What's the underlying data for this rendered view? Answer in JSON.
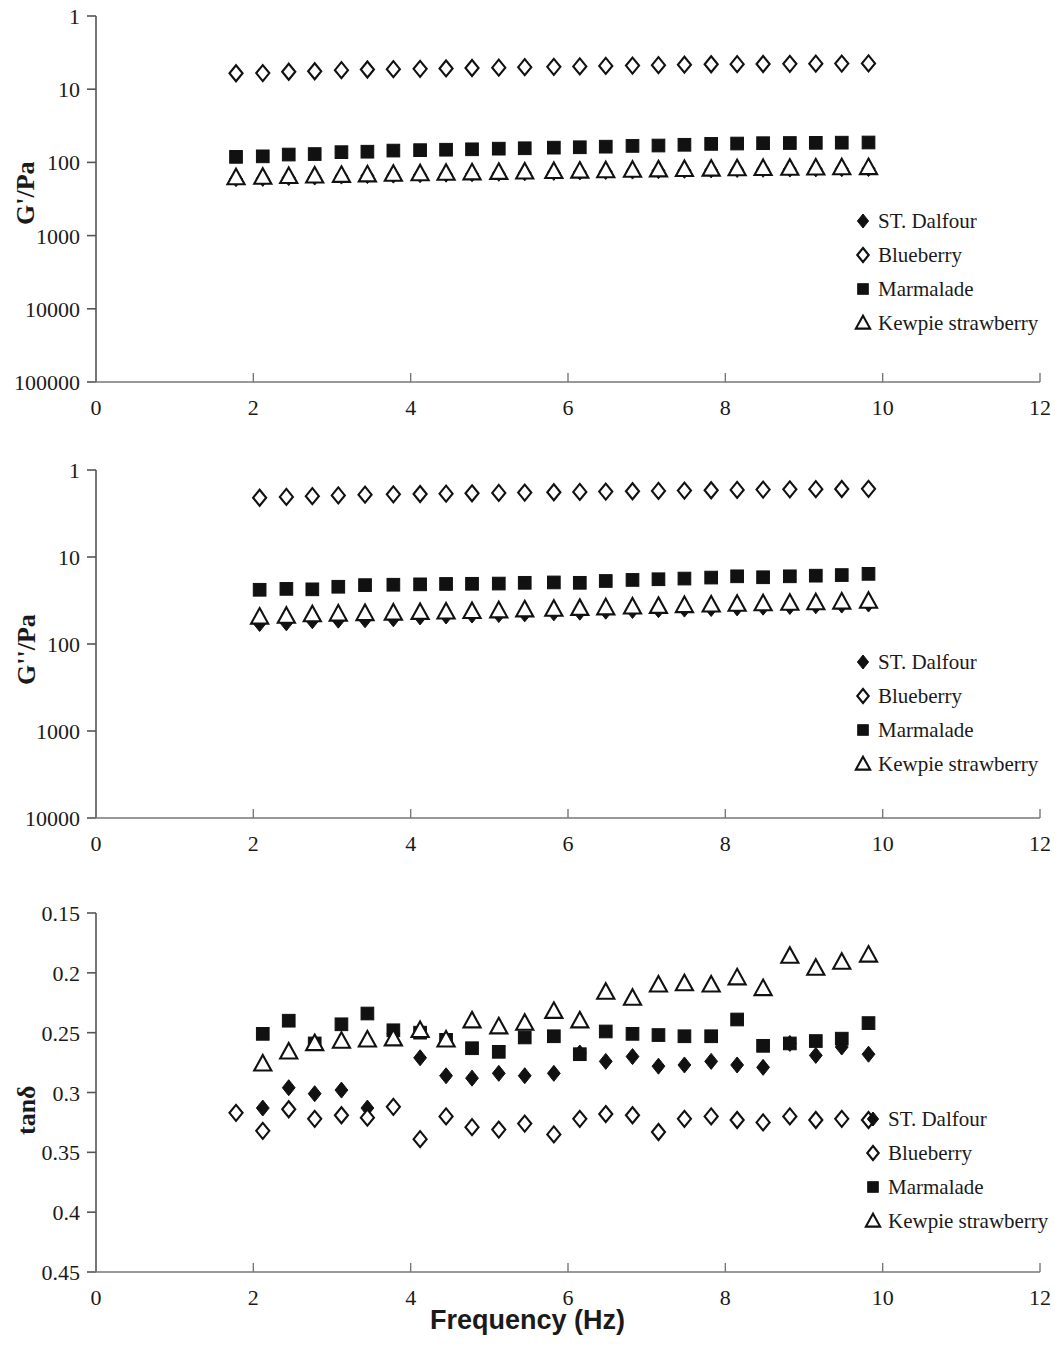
{
  "figure": {
    "xaxis_title": "Frequency (Hz)",
    "series_names": [
      "ST. Dalfour",
      "Blueberry",
      "Marmalade",
      "Kewpie strawberry"
    ],
    "marker_shapes": [
      "filled-diamond",
      "open-diamond",
      "filled-square",
      "open-triangle"
    ],
    "series_color": "#111111"
  },
  "legend": {
    "items": [
      {
        "label": "ST. Dalfour",
        "marker": "filled-diamond"
      },
      {
        "label": "Blueberry",
        "marker": "open-diamond"
      },
      {
        "label": "Marmalade",
        "marker": "filled-square"
      },
      {
        "label": "Kewpie strawberry",
        "marker": "open-triangle"
      }
    ]
  },
  "panel1": {
    "ylabel": "G'/Pa",
    "ytick_labels": [
      "100000",
      "10000",
      "1000",
      "100",
      "10",
      "1"
    ],
    "xtick_labels": [
      "0",
      "2",
      "4",
      "6",
      "8",
      "10",
      "12"
    ]
  },
  "panel2": {
    "ylabel": "G''/Pa",
    "ytick_labels": [
      "10000",
      "1000",
      "100",
      "10",
      "1"
    ],
    "xtick_labels": [
      "0",
      "2",
      "4",
      "6",
      "8",
      "10",
      "12"
    ]
  },
  "panel3": {
    "ylabel": "tanδ",
    "ytick_labels": [
      "0.45",
      "0.4",
      "0.35",
      "0.3",
      "0.25",
      "0.2",
      "0.15"
    ],
    "xtick_labels": [
      "0",
      "2",
      "4",
      "6",
      "8",
      "10",
      "12"
    ]
  },
  "chart_data": [
    {
      "type": "scatter",
      "title": "",
      "xlabel": "Frequency (Hz)",
      "ylabel": "G'/Pa",
      "yscale": "log",
      "ylim": [
        1,
        100000
      ],
      "yticks": [
        1,
        10,
        100,
        1000,
        10000,
        100000
      ],
      "xlim": [
        0,
        12
      ],
      "xticks": [
        0,
        2,
        4,
        6,
        8,
        10,
        12
      ],
      "grid": false,
      "legend_position": "right-middle",
      "x": [
        1.78,
        2.12,
        2.45,
        2.78,
        3.12,
        3.45,
        3.78,
        4.12,
        4.45,
        4.78,
        5.12,
        5.45,
        5.82,
        6.15,
        6.48,
        6.82,
        7.15,
        7.48,
        7.82,
        8.15,
        8.48,
        8.82,
        9.15,
        9.48,
        9.82
      ],
      "series": [
        {
          "name": "ST. Dalfour",
          "marker": "filled-diamond",
          "values": [
            600,
            605,
            620,
            630,
            650,
            660,
            670,
            680,
            690,
            700,
            710,
            720,
            730,
            740,
            750,
            760,
            770,
            780,
            790,
            800,
            805,
            810,
            815,
            820,
            825
          ]
        },
        {
          "name": "Blueberry",
          "marker": "open-diamond",
          "values": [
            16500,
            16600,
            17300,
            17600,
            18200,
            18600,
            18800,
            19000,
            19200,
            19500,
            19700,
            20000,
            20200,
            20500,
            20800,
            21000,
            21300,
            21600,
            21900,
            22000,
            22100,
            22200,
            22300,
            22400,
            22500
          ]
        },
        {
          "name": "Marmalade",
          "marker": "filled-square",
          "values": [
            1190,
            1210,
            1280,
            1300,
            1380,
            1400,
            1450,
            1470,
            1490,
            1510,
            1540,
            1560,
            1590,
            1610,
            1640,
            1680,
            1700,
            1740,
            1790,
            1810,
            1830,
            1840,
            1850,
            1860,
            1870
          ]
        },
        {
          "name": "Kewpie strawberry",
          "marker": "open-triangle",
          "values": [
            620,
            630,
            645,
            655,
            670,
            680,
            695,
            705,
            715,
            725,
            735,
            745,
            755,
            765,
            775,
            785,
            795,
            805,
            815,
            825,
            830,
            838,
            845,
            850,
            855
          ]
        }
      ]
    },
    {
      "type": "scatter",
      "title": "",
      "xlabel": "Frequency (Hz)",
      "ylabel": "G''/Pa",
      "yscale": "log",
      "ylim": [
        1,
        10000
      ],
      "yticks": [
        1,
        10,
        100,
        1000,
        10000
      ],
      "xlim": [
        0,
        12
      ],
      "xticks": [
        0,
        2,
        4,
        6,
        8,
        10,
        12
      ],
      "grid": false,
      "legend_position": "right-middle",
      "x": [
        2.08,
        2.42,
        2.75,
        3.08,
        3.42,
        3.78,
        4.12,
        4.45,
        4.78,
        5.12,
        5.45,
        5.82,
        6.15,
        6.48,
        6.82,
        7.15,
        7.48,
        7.82,
        8.15,
        8.48,
        8.82,
        9.15,
        9.48,
        9.82
      ],
      "series": [
        {
          "name": "ST. Dalfour",
          "marker": "filled-diamond",
          "values": [
            172,
            175,
            185,
            188,
            190,
            195,
            205,
            210,
            215,
            218,
            222,
            228,
            232,
            238,
            243,
            248,
            252,
            256,
            260,
            265,
            270,
            275,
            280,
            288
          ]
        },
        {
          "name": "Blueberry",
          "marker": "open-diamond",
          "values": [
            4800,
            4900,
            5000,
            5100,
            5200,
            5250,
            5300,
            5350,
            5400,
            5450,
            5500,
            5550,
            5600,
            5650,
            5700,
            5750,
            5800,
            5850,
            5900,
            5950,
            6000,
            6020,
            6050,
            6080
          ]
        },
        {
          "name": "Marmalade",
          "marker": "filled-square",
          "values": [
            420,
            430,
            425,
            455,
            475,
            480,
            485,
            490,
            492,
            495,
            505,
            510,
            505,
            530,
            545,
            555,
            565,
            580,
            600,
            585,
            600,
            610,
            620,
            640
          ]
        },
        {
          "name": "Kewpie strawberry",
          "marker": "open-triangle",
          "values": [
            205,
            210,
            218,
            222,
            225,
            228,
            232,
            235,
            238,
            242,
            248,
            252,
            258,
            262,
            268,
            272,
            278,
            282,
            288,
            292,
            296,
            300,
            305,
            312
          ]
        }
      ]
    },
    {
      "type": "scatter",
      "title": "",
      "xlabel": "Frequency (Hz)",
      "ylabel": "tanδ",
      "yscale": "linear",
      "ylim": [
        0.15,
        0.45
      ],
      "yticks": [
        0.15,
        0.2,
        0.25,
        0.3,
        0.35,
        0.4,
        0.45
      ],
      "xlim": [
        0,
        12
      ],
      "xticks": [
        0,
        2,
        4,
        6,
        8,
        10,
        12
      ],
      "grid": false,
      "legend_position": "right-bottom",
      "x": [
        1.78,
        2.12,
        2.45,
        2.78,
        3.12,
        3.45,
        3.78,
        4.12,
        4.45,
        4.78,
        5.12,
        5.45,
        5.82,
        6.15,
        6.48,
        6.82,
        7.15,
        7.48,
        7.82,
        8.15,
        8.48,
        8.82,
        9.15,
        9.48,
        9.82
      ],
      "series": [
        {
          "name": "ST. Dalfour",
          "marker": "filled-diamond",
          "values": [
            null,
            0.287,
            0.304,
            0.299,
            0.302,
            0.287,
            0.349,
            0.329,
            0.314,
            0.312,
            0.316,
            0.314,
            0.316,
            0.333,
            0.326,
            0.33,
            0.322,
            0.323,
            0.326,
            0.323,
            0.321,
            0.341,
            0.331,
            0.338,
            0.332
          ]
        },
        {
          "name": "Blueberry",
          "marker": "open-diamond",
          "values": [
            0.283,
            0.268,
            0.286,
            0.278,
            0.281,
            0.279,
            0.288,
            0.261,
            0.28,
            0.271,
            0.269,
            0.274,
            0.265,
            0.278,
            0.282,
            0.281,
            0.267,
            0.278,
            0.28,
            0.277,
            0.275,
            0.28,
            0.277,
            0.278,
            0.277
          ]
        },
        {
          "name": "Marmalade",
          "marker": "filled-square",
          "values": [
            null,
            0.349,
            0.36,
            0.341,
            0.357,
            0.366,
            0.352,
            0.35,
            0.344,
            0.337,
            0.334,
            0.346,
            0.347,
            0.332,
            0.351,
            0.349,
            0.348,
            0.347,
            0.347,
            0.361,
            0.339,
            0.341,
            0.343,
            0.345,
            0.358
          ]
        },
        {
          "name": "Kewpie strawberry",
          "marker": "open-triangle",
          "values": [
            null,
            0.324,
            0.334,
            0.341,
            0.343,
            0.344,
            0.345,
            0.352,
            0.344,
            0.36,
            0.355,
            0.358,
            0.368,
            0.36,
            0.384,
            0.379,
            0.39,
            0.391,
            0.39,
            0.396,
            0.387,
            0.414,
            0.404,
            0.409,
            0.415
          ]
        }
      ]
    }
  ]
}
